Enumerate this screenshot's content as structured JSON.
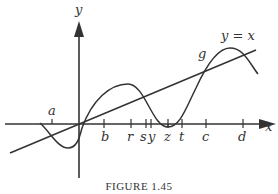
{
  "figure": {
    "caption": "FIGURE 1.45",
    "axes": {
      "x_label": "x",
      "y_label": "y"
    },
    "line_label": "y = x",
    "curve_label": "g",
    "ticks": [
      {
        "label": "a",
        "pos": "above"
      },
      {
        "label": "b",
        "pos": "below"
      },
      {
        "label": "r",
        "pos": "below"
      },
      {
        "label": "s",
        "pos": "below"
      },
      {
        "label": "y",
        "pos": "below"
      },
      {
        "label": "z",
        "pos": "below"
      },
      {
        "label": "t",
        "pos": "below"
      },
      {
        "label": "c",
        "pos": "below"
      },
      {
        "label": "d",
        "pos": "below"
      }
    ],
    "colors": {
      "ink": "#333333",
      "background": "#ffffff"
    }
  }
}
